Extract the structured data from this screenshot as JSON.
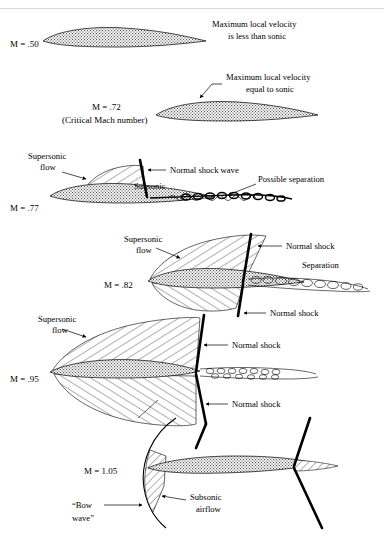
{
  "figure": {
    "background": "#ffffff",
    "ink": "#000000",
    "width": 384,
    "height": 536
  },
  "panels": [
    {
      "id": "m050",
      "mach_label": "M = .50",
      "mach_value": 0.5,
      "sublabel": "",
      "annotations": [
        {
          "name": "max-velocity-note",
          "lines": [
            "Maximum local velocity",
            "is less than sonic"
          ]
        }
      ],
      "features": [
        "airfoil"
      ],
      "has_shock": false,
      "has_supersonic_region": false,
      "has_separation": false
    },
    {
      "id": "m072",
      "mach_label": "M = .72",
      "mach_value": 0.72,
      "sublabel": "(Critical Mach number)",
      "annotations": [
        {
          "name": "sonic-point-note",
          "lines": [
            "Maximum local velocity",
            "equal to sonic"
          ]
        }
      ],
      "features": [
        "airfoil",
        "sonic-point-leader"
      ],
      "has_shock": false,
      "has_supersonic_region": false,
      "has_separation": false
    },
    {
      "id": "m077",
      "mach_label": "M = .77",
      "mach_value": 0.77,
      "sublabel": "",
      "annotations": [
        {
          "name": "supersonic-flow-label",
          "lines": [
            "Supersonic",
            "flow"
          ]
        },
        {
          "name": "normal-shock-wave-label",
          "lines": [
            "Normal shock wave"
          ]
        },
        {
          "name": "subsonic-label",
          "lines": [
            "Subsonic"
          ]
        },
        {
          "name": "possible-separation-label",
          "lines": [
            "Possible separation"
          ]
        }
      ],
      "features": [
        "airfoil",
        "upper-supersonic-region",
        "upper-normal-shock",
        "separation-wake"
      ],
      "has_shock": true,
      "has_supersonic_region": true,
      "has_separation": true
    },
    {
      "id": "m082",
      "mach_label": "M = .82",
      "mach_value": 0.82,
      "sublabel": "",
      "annotations": [
        {
          "name": "supersonic-flow-label",
          "lines": [
            "Supersonic",
            "flow"
          ]
        },
        {
          "name": "normal-shock-upper-label",
          "lines": [
            "Normal shock"
          ]
        },
        {
          "name": "normal-shock-lower-label",
          "lines": [
            "Normal shock"
          ]
        },
        {
          "name": "separation-label",
          "lines": [
            "Separation"
          ]
        }
      ],
      "features": [
        "airfoil",
        "upper-supersonic-region",
        "lower-supersonic-region",
        "upper-normal-shock",
        "lower-normal-shock",
        "separation-wake"
      ],
      "has_shock": true,
      "has_supersonic_region": true,
      "has_separation": true
    },
    {
      "id": "m095",
      "mach_label": "M = .95",
      "mach_value": 0.95,
      "sublabel": "",
      "annotations": [
        {
          "name": "supersonic-flow-label",
          "lines": [
            "Supersonic",
            "flow"
          ]
        },
        {
          "name": "normal-shock-upper-label",
          "lines": [
            "Normal shock"
          ]
        },
        {
          "name": "normal-shock-lower-label",
          "lines": [
            "Normal shock"
          ]
        }
      ],
      "features": [
        "airfoil",
        "upper-supersonic-region",
        "lower-supersonic-region",
        "upper-normal-shock",
        "lower-normal-shock",
        "separation-wake"
      ],
      "has_shock": true,
      "has_supersonic_region": true,
      "has_separation": true
    },
    {
      "id": "m105",
      "mach_label": "M = 1.05",
      "mach_value": 1.05,
      "sublabel": "",
      "annotations": [
        {
          "name": "bow-wave-label",
          "lines": [
            "“Bow",
            "wave”"
          ]
        },
        {
          "name": "subsonic-airflow-label",
          "lines": [
            "Subsonic",
            "airflow"
          ]
        }
      ],
      "features": [
        "airfoil",
        "bow-wave",
        "subsonic-pocket",
        "trailing-edge-shocks"
      ],
      "has_shock": true,
      "has_supersonic_region": false,
      "has_separation": false
    }
  ],
  "legend_terms": {
    "supersonic": "Supersonic",
    "flow": "flow",
    "subsonic": "Subsonic",
    "normal_shock": "Normal shock",
    "normal_shock_wave": "Normal shock wave",
    "separation": "Separation",
    "possible_separation": "Possible separation",
    "bow_wave": "“Bow wave”",
    "subsonic_airflow": "Subsonic airflow"
  }
}
